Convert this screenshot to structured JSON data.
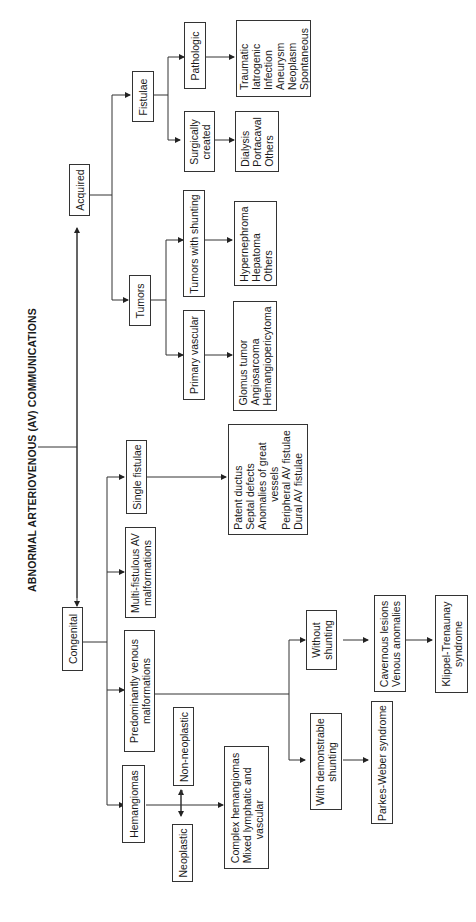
{
  "title": "ABNORMAL ARTERIOVENOUS (AV) COMMUNICATIONS",
  "nodes": {
    "congenital": "Congenital",
    "acquired": "Acquired",
    "hemangiomas": "Hemangiomas",
    "predominantly_venous": [
      "Predominantly venous",
      "malformations"
    ],
    "multi_fistulous": [
      "Multi-fistulous AV",
      "malformations"
    ],
    "single_fistulae": "Single fistulae",
    "single_fistulae_list": [
      "Patent ductus",
      "Septal defects",
      "Anomalies of great",
      "vessels",
      "Peripheral AV fistulae",
      "Dural AV fistulae"
    ],
    "neoplastic": "Neoplastic",
    "non_neoplastic": "Non-neoplastic",
    "complex_hemangiomas": [
      "Complex hemangiomas",
      "Mixed lymphatic and",
      "vascular"
    ],
    "with_shunting": [
      "With demonstrable",
      "shunting"
    ],
    "without_shunting": [
      "Without",
      "shunting"
    ],
    "parkes_weber": "Parkes-Weber syndrome",
    "cavernous": [
      "Cavernous lesions",
      "Venous anomalies"
    ],
    "klippel": [
      "Klippel-Trenaunay",
      "syndrome"
    ],
    "tumors": "Tumors",
    "fistulae": "Fistulae",
    "primary_vascular": "Primary vascular",
    "primary_vascular_list": [
      "Glomus tumor",
      "Angiosarcoma",
      "Hemangiopericytoma"
    ],
    "tumors_shunting": "Tumors with shunting",
    "tumors_shunting_list": [
      "Hypernephroma",
      "Hepatoma",
      "Others"
    ],
    "surgically_created": [
      "Surgically",
      "created"
    ],
    "surgically_list": [
      "Dialysis",
      "Portacaval",
      "Others"
    ],
    "pathologic": "Pathologic",
    "pathologic_list": [
      "Traumatic",
      "Iatrogenic",
      "Infection",
      "Aneurysm",
      "Neoplasm",
      "Spontaneous"
    ]
  }
}
